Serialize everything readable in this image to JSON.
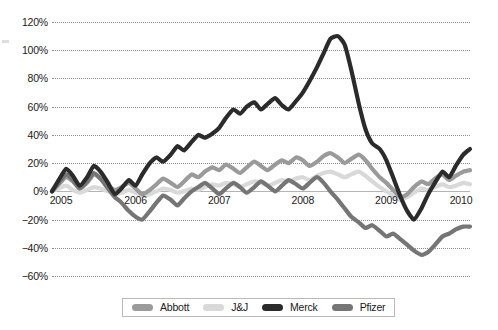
{
  "chart_data": {
    "type": "line",
    "title": "",
    "subtitle": "",
    "xlabel": "",
    "ylabel": "",
    "ylim": [
      -60,
      120
    ],
    "xlim": [
      2005,
      2010
    ],
    "grid": true,
    "grid_style": "dotted-horizontal",
    "legend_position": "bottom-center",
    "value_format": "percent",
    "y_ticks": [
      120,
      100,
      80,
      60,
      40,
      20,
      0,
      -20,
      -40,
      -60
    ],
    "y_tick_labels": [
      "120%",
      "100%",
      "80%",
      "60%",
      "40%",
      "20%",
      "0%",
      "−20%",
      "−40%",
      "−60%"
    ],
    "x_ticks": [
      2005,
      2006,
      2007,
      2008,
      2009,
      2010
    ],
    "x_tick_labels": [
      "2005",
      "2006",
      "2007",
      "2008",
      "2009",
      "2010"
    ],
    "colors": {
      "abbott": "#9a9a9a",
      "jnj": "#d9d9d9",
      "merck": "#2b2b2b",
      "pfizer": "#757575",
      "gridline": "#8d8d8d",
      "axis": "#b4b4b4",
      "text": "#1a1a1a",
      "background": "#ffffff",
      "legend_border": "#b9b9b9"
    },
    "series": [
      {
        "name": "Abbott",
        "color": "#9a9a9a",
        "x": [
          2005.0,
          2005.08,
          2005.17,
          2005.25,
          2005.33,
          2005.42,
          2005.5,
          2005.58,
          2005.67,
          2005.75,
          2005.83,
          2005.92,
          2006.0,
          2006.08,
          2006.17,
          2006.25,
          2006.33,
          2006.42,
          2006.5,
          2006.58,
          2006.67,
          2006.75,
          2006.83,
          2006.92,
          2007.0,
          2007.08,
          2007.17,
          2007.25,
          2007.33,
          2007.42,
          2007.5,
          2007.58,
          2007.67,
          2007.75,
          2007.83,
          2007.92,
          2008.0,
          2008.08,
          2008.17,
          2008.25,
          2008.33,
          2008.42,
          2008.5,
          2008.58,
          2008.67,
          2008.75,
          2008.83,
          2008.92,
          2009.0,
          2009.08,
          2009.17,
          2009.25,
          2009.33,
          2009.42,
          2009.5,
          2009.58,
          2009.67,
          2009.75,
          2009.83,
          2009.92,
          2010.0
        ],
        "values": [
          0,
          5,
          10,
          7,
          2,
          6,
          12,
          9,
          4,
          1,
          3,
          6,
          2,
          -2,
          1,
          5,
          9,
          6,
          3,
          7,
          12,
          10,
          14,
          17,
          15,
          19,
          16,
          13,
          17,
          21,
          18,
          15,
          19,
          22,
          20,
          24,
          22,
          18,
          21,
          25,
          27,
          24,
          20,
          23,
          26,
          22,
          16,
          10,
          6,
          1,
          -4,
          -2,
          3,
          7,
          5,
          9,
          12,
          8,
          11,
          14,
          15
        ]
      },
      {
        "name": "J&J",
        "color": "#d9d9d9",
        "x": [
          2005.0,
          2005.08,
          2005.17,
          2005.25,
          2005.33,
          2005.42,
          2005.5,
          2005.58,
          2005.67,
          2005.75,
          2005.83,
          2005.92,
          2006.0,
          2006.08,
          2006.17,
          2006.25,
          2006.33,
          2006.42,
          2006.5,
          2006.58,
          2006.67,
          2006.75,
          2006.83,
          2006.92,
          2007.0,
          2007.08,
          2007.17,
          2007.25,
          2007.33,
          2007.42,
          2007.5,
          2007.58,
          2007.67,
          2007.75,
          2007.83,
          2007.92,
          2008.0,
          2008.08,
          2008.17,
          2008.25,
          2008.33,
          2008.42,
          2008.5,
          2008.58,
          2008.67,
          2008.75,
          2008.83,
          2008.92,
          2009.0,
          2009.08,
          2009.17,
          2009.25,
          2009.33,
          2009.42,
          2009.5,
          2009.58,
          2009.67,
          2009.75,
          2009.83,
          2009.92,
          2010.0
        ],
        "values": [
          0,
          2,
          4,
          1,
          -1,
          1,
          3,
          2,
          0,
          -2,
          -1,
          1,
          -1,
          -3,
          -2,
          0,
          2,
          1,
          -1,
          0,
          2,
          1,
          3,
          5,
          4,
          6,
          5,
          3,
          5,
          7,
          6,
          4,
          6,
          8,
          7,
          9,
          10,
          8,
          11,
          13,
          14,
          12,
          10,
          12,
          14,
          11,
          7,
          3,
          0,
          -3,
          -6,
          -4,
          -1,
          2,
          1,
          3,
          5,
          3,
          4,
          6,
          5
        ]
      },
      {
        "name": "Merck",
        "color": "#2b2b2b",
        "x": [
          2005.0,
          2005.08,
          2005.17,
          2005.25,
          2005.33,
          2005.42,
          2005.5,
          2005.58,
          2005.67,
          2005.75,
          2005.83,
          2005.92,
          2006.0,
          2006.08,
          2006.17,
          2006.25,
          2006.33,
          2006.42,
          2006.5,
          2006.58,
          2006.67,
          2006.75,
          2006.83,
          2006.92,
          2007.0,
          2007.08,
          2007.17,
          2007.25,
          2007.33,
          2007.42,
          2007.5,
          2007.58,
          2007.67,
          2007.75,
          2007.83,
          2007.92,
          2008.0,
          2008.08,
          2008.17,
          2008.25,
          2008.33,
          2008.42,
          2008.5,
          2008.58,
          2008.67,
          2008.75,
          2008.83,
          2008.92,
          2009.0,
          2009.08,
          2009.17,
          2009.25,
          2009.33,
          2009.42,
          2009.5,
          2009.58,
          2009.67,
          2009.75,
          2009.83,
          2009.92,
          2010.0
        ],
        "values": [
          0,
          8,
          16,
          11,
          4,
          10,
          18,
          14,
          6,
          -2,
          2,
          8,
          4,
          12,
          20,
          24,
          21,
          26,
          32,
          29,
          35,
          40,
          38,
          41,
          45,
          52,
          58,
          55,
          60,
          63,
          58,
          62,
          66,
          61,
          58,
          64,
          70,
          78,
          88,
          98,
          108,
          110,
          104,
          86,
          62,
          44,
          34,
          30,
          22,
          10,
          -4,
          -14,
          -20,
          -12,
          -2,
          6,
          14,
          10,
          18,
          26,
          30
        ]
      },
      {
        "name": "Pfizer",
        "color": "#757575",
        "x": [
          2005.0,
          2005.08,
          2005.17,
          2005.25,
          2005.33,
          2005.42,
          2005.5,
          2005.58,
          2005.67,
          2005.75,
          2005.83,
          2005.92,
          2006.0,
          2006.08,
          2006.17,
          2006.25,
          2006.33,
          2006.42,
          2006.5,
          2006.58,
          2006.67,
          2006.75,
          2006.83,
          2006.92,
          2007.0,
          2007.08,
          2007.17,
          2007.25,
          2007.33,
          2007.42,
          2007.5,
          2007.58,
          2007.67,
          2007.75,
          2007.83,
          2007.92,
          2008.0,
          2008.08,
          2008.17,
          2008.25,
          2008.33,
          2008.42,
          2008.5,
          2008.58,
          2008.67,
          2008.75,
          2008.83,
          2008.92,
          2009.0,
          2009.08,
          2009.17,
          2009.25,
          2009.33,
          2009.42,
          2009.5,
          2009.58,
          2009.67,
          2009.75,
          2009.83,
          2009.92,
          2010.0
        ],
        "values": [
          0,
          6,
          12,
          8,
          2,
          7,
          13,
          9,
          2,
          -4,
          -8,
          -14,
          -18,
          -20,
          -14,
          -8,
          -3,
          -6,
          -10,
          -5,
          0,
          3,
          6,
          2,
          -2,
          2,
          6,
          3,
          -1,
          3,
          7,
          4,
          0,
          4,
          8,
          5,
          2,
          6,
          10,
          6,
          0,
          -6,
          -12,
          -18,
          -22,
          -26,
          -24,
          -28,
          -32,
          -30,
          -34,
          -38,
          -42,
          -45,
          -43,
          -38,
          -32,
          -30,
          -27,
          -25,
          -25
        ]
      }
    ]
  },
  "legend": {
    "items": [
      {
        "label": "Abbott",
        "color": "#9a9a9a"
      },
      {
        "label": "J&J",
        "color": "#d9d9d9"
      },
      {
        "label": "Merck",
        "color": "#2b2b2b"
      },
      {
        "label": "Pfizer",
        "color": "#757575"
      }
    ]
  }
}
